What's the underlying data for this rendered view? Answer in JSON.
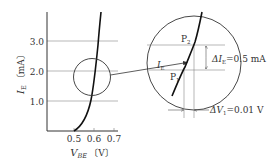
{
  "graph": {
    "y_axis_label_main": "I",
    "y_axis_label_sub": "E",
    "y_axis_unit": "〔mA〕",
    "y_ticks": [
      "3.0",
      "2.0",
      "1.0"
    ],
    "x_axis_label_main": "V",
    "x_axis_label_sub": "BE",
    "x_axis_unit": "〔V〕",
    "x_ticks": [
      "0.5",
      "0.6",
      "0.7"
    ]
  },
  "magnified": {
    "point_upper_main": "P",
    "point_upper_sub": "2",
    "point_lower_main": "P",
    "point_lower_sub": "1",
    "ie_label_main": "I",
    "ie_label_sub": "E",
    "delta_ie_main": "ΔI",
    "delta_ie_sub": "E",
    "delta_ie_value": "=0.5 mA",
    "delta_v_main": "ΔV",
    "delta_v_sub": "1",
    "delta_v_value": "=0.01 V"
  },
  "colors": {
    "curve": "#111111",
    "axis": "#333333",
    "grid": "#888888",
    "text": "#333333"
  }
}
